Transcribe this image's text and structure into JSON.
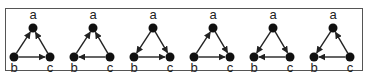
{
  "diagram": {
    "title": "",
    "node_labels": {
      "a": "a",
      "b": "b",
      "c": "c"
    },
    "colors": {
      "node": "#111111",
      "edge": "#222222",
      "frame": "#555555"
    },
    "triangles": [
      {
        "id": 1,
        "edges": [
          [
            "b",
            "a"
          ],
          [
            "c",
            "a"
          ],
          [
            "b",
            "c"
          ]
        ]
      },
      {
        "id": 2,
        "edges": [
          [
            "b",
            "a"
          ],
          [
            "c",
            "a"
          ],
          [
            "c",
            "b"
          ]
        ]
      },
      {
        "id": 3,
        "edges": [
          [
            "a",
            "b"
          ],
          [
            "a",
            "c"
          ],
          [
            "b",
            "c"
          ]
        ]
      },
      {
        "id": 4,
        "edges": [
          [
            "b",
            "a"
          ],
          [
            "a",
            "c"
          ],
          [
            "b",
            "c"
          ]
        ]
      },
      {
        "id": 5,
        "edges": [
          [
            "a",
            "b"
          ],
          [
            "a",
            "c"
          ],
          [
            "c",
            "b"
          ]
        ]
      },
      {
        "id": 6,
        "edges": [
          [
            "a",
            "b"
          ],
          [
            "c",
            "a"
          ],
          [
            "c",
            "b"
          ]
        ]
      }
    ]
  }
}
